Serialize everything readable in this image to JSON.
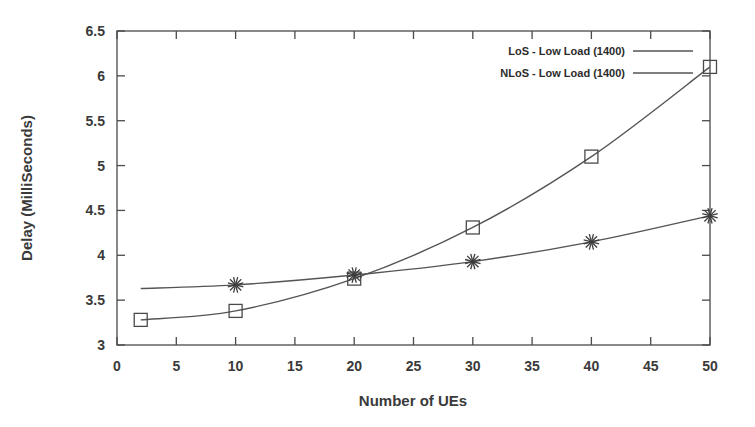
{
  "chart_data": {
    "type": "line",
    "title": "",
    "xlabel": "Number of UEs",
    "ylabel": "Delay (MilliSeconds)",
    "xlim": [
      0,
      50
    ],
    "ylim": [
      3,
      6.5
    ],
    "xticks": [
      0,
      5,
      10,
      15,
      20,
      25,
      30,
      35,
      40,
      45,
      50
    ],
    "xtick_labels": [
      "0",
      "5",
      "10",
      "15",
      "20",
      "25",
      "30",
      "35",
      "40",
      "45",
      "50"
    ],
    "yticks": [
      3,
      3.5,
      4,
      4.5,
      5,
      5.5,
      6,
      6.5
    ],
    "ytick_labels": [
      "3",
      "3.5",
      "4",
      "4.5",
      "5",
      "5.5",
      "6",
      "6.5"
    ],
    "grid": false,
    "legend_position": "top-right",
    "frame": "box",
    "series": [
      {
        "name": "LoS - Low Load (1400)",
        "marker": "square",
        "color": "#4a4a4a",
        "x": [
          2,
          10,
          20,
          30,
          40,
          50
        ],
        "values": [
          3.28,
          3.38,
          3.74,
          4.31,
          5.1,
          6.1
        ]
      },
      {
        "name": "NLoS - Low Load (1400)",
        "marker": "star",
        "color": "#3d3d3d",
        "x": [
          2,
          10,
          20,
          30,
          40,
          50
        ],
        "values": [
          3.63,
          3.67,
          3.78,
          3.93,
          4.15,
          4.44
        ],
        "marker_x": [
          10,
          20,
          30,
          40,
          50
        ],
        "marker_values": [
          3.67,
          3.78,
          3.93,
          4.15,
          4.44
        ]
      }
    ]
  },
  "legend": {
    "entries": [
      {
        "label": "LoS - Low Load (1400)"
      },
      {
        "label": "NLoS - Low Load (1400)"
      }
    ]
  },
  "axes": {
    "x_title": "Number of UEs",
    "y_title": "Delay (MilliSeconds)"
  }
}
